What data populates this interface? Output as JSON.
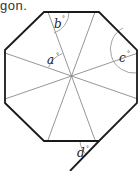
{
  "caption": "gon.",
  "figure": {
    "shape": "regular octagon",
    "colors": {
      "outline": "#1a1a1a",
      "diagonal": "#8a8a8a",
      "arc": "#9a9a9a"
    },
    "angles": [
      {
        "id": "a",
        "label": "a",
        "unit": "°"
      },
      {
        "id": "b",
        "label": "b",
        "unit": "°"
      },
      {
        "id": "c",
        "label": "c",
        "unit": "°"
      },
      {
        "id": "d",
        "label": "d",
        "unit": "°"
      }
    ]
  }
}
